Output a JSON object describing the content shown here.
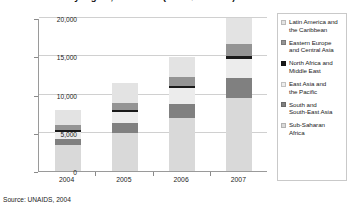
{
  "chart_data": {
    "type": "bar",
    "subtype": "stacked-column",
    "title": "by region, 2004-2007 (in US$ millions)",
    "xlabel": "",
    "ylabel": "",
    "categories": [
      "2004",
      "2005",
      "2006",
      "2007"
    ],
    "ylim": [
      0,
      20000
    ],
    "yticks": [
      0,
      5000,
      10000,
      15000,
      20000
    ],
    "ytick_labels": [
      "0",
      "5,000",
      "10,000",
      "15,000",
      "20,000"
    ],
    "grid": true,
    "legend_position": "right",
    "series": [
      {
        "name": "Sub-Saharan Africa",
        "color": "#d9d9d9",
        "values": [
          3400,
          5000,
          6900,
          9600
        ]
      },
      {
        "name": "South and South-East Asia",
        "color": "#808080",
        "values": [
          800,
          1300,
          1900,
          2600
        ]
      },
      {
        "name": "East Asia and the Pacific",
        "color": "#ececec",
        "values": [
          900,
          1400,
          2000,
          2500
        ]
      },
      {
        "name": "North Africa and Middle East",
        "color": "#1a1a1a",
        "values": [
          230,
          300,
          350,
          400
        ]
      },
      {
        "name": "Eastern Europe and Central Asia",
        "color": "#949494",
        "values": [
          600,
          900,
          1150,
          1500
        ]
      },
      {
        "name": "Latin America and the Caribbean",
        "color": "#e3e3e3",
        "values": [
          2070,
          2600,
          2600,
          3400
        ]
      }
    ],
    "totals": [
      8000,
      11500,
      14900,
      20000
    ],
    "source": "Source: UNAIDS, 2004"
  },
  "legend": {
    "items": [
      {
        "label_line1": "Latin America and",
        "label_line2": "the Caribbean"
      },
      {
        "label_line1": "Eastern Europe",
        "label_line2": "and Central Asia"
      },
      {
        "label_line1": "North Africa and",
        "label_line2": "Middle East"
      },
      {
        "label_line1": "East Asia and",
        "label_line2": "the Pacific"
      },
      {
        "label_line1": "South and",
        "label_line2": "South-East Asia"
      },
      {
        "label_line1": "Sub-Saharan",
        "label_line2": "Africa"
      }
    ]
  }
}
